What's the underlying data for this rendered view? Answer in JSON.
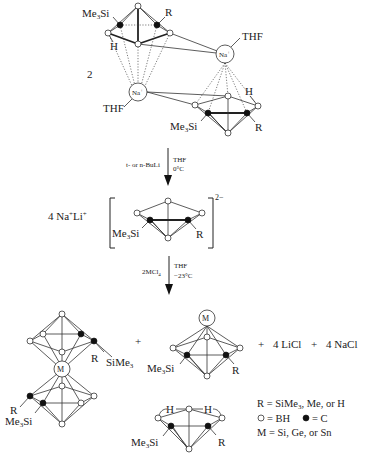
{
  "diagram": {
    "reactant": {
      "coefficient": "2",
      "labels": {
        "me3si_top": "Me3Si",
        "r_top": "R",
        "h_top": "H",
        "na_top": "Na",
        "thf_top": "THF",
        "na_left": "Na",
        "thf_left": "THF",
        "h_bottom": "H",
        "me3si_bottom": "Me3Si",
        "r_bottom": "R"
      }
    },
    "step1": {
      "reagent": "t- or n-BuLi",
      "solvent": "THF",
      "temperature": "0°C"
    },
    "intermediate": {
      "coefficient": "4 Na⁺Li⁺",
      "charge": "2−",
      "me3si": "Me3Si",
      "r": "R"
    },
    "step2": {
      "reagent": "2MCl4",
      "solvent": "THF",
      "temperature": "−23°C"
    },
    "products": {
      "sandwich": {
        "metal": "M",
        "r_top": "R",
        "sime3_top": "SiMe3",
        "r_bottom": "R",
        "me3si_bottom": "Me3Si"
      },
      "plus1": "+",
      "closo": {
        "metal": "M",
        "me3si": "Me3Si",
        "r": "R"
      },
      "plus2": "+",
      "licl": "4 LiCl",
      "plus3": "+",
      "nacl": "4 NaCl",
      "nido": {
        "h_left": "H",
        "h_right": "H",
        "me3si": "Me3Si",
        "r": "R"
      }
    },
    "legend": {
      "r_def": "R = SiMe3, Me, or H",
      "bh_def": "= BH",
      "c_def": "= C",
      "m_def": "M = Si, Ge, or Sn"
    }
  }
}
